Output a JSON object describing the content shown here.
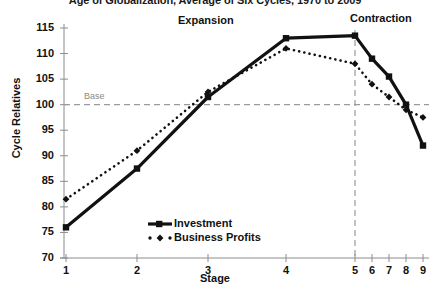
{
  "chart_data": {
    "type": "line",
    "title": "Age of Globalization, Average of Six Cycles, 1970 to 2009",
    "xlabel": "Stage",
    "ylabel": "Cycle Relatives",
    "categories": [
      "1",
      "2",
      "3",
      "4",
      "5",
      "6",
      "7",
      "8",
      "9"
    ],
    "x_tick_labels": [
      "1",
      "2",
      "3",
      "4",
      "5",
      "6",
      "7",
      "8",
      "9"
    ],
    "y_tick_labels": [
      "70",
      "75",
      "80",
      "85",
      "90",
      "95",
      "100",
      "105",
      "110",
      "115"
    ],
    "ylim": [
      70,
      115
    ],
    "grid": false,
    "legend_position": "inside-bottom-center",
    "series": [
      {
        "name": "Investment",
        "marker": "square",
        "line_style": "solid",
        "color": "#111111",
        "values": [
          76.0,
          87.5,
          101.5,
          113.0,
          113.5,
          109.0,
          105.5,
          100.0,
          92.0
        ]
      },
      {
        "name": "Business Profits",
        "marker": "diamond",
        "line_style": "dotted",
        "color": "#111111",
        "values": [
          81.5,
          91.0,
          102.5,
          111.0,
          108.0,
          104.0,
          101.5,
          99.0,
          97.5
        ]
      }
    ],
    "annotations": [
      {
        "name": "expansion-label",
        "text": "Expansion"
      },
      {
        "name": "contraction-label",
        "text": "Contraction"
      },
      {
        "name": "base-label",
        "text": "Base"
      }
    ],
    "reference_lines": [
      {
        "name": "base-line",
        "orientation": "horizontal",
        "value": 100,
        "style": "dashed",
        "color": "#9a9a9a"
      },
      {
        "name": "peak-divider",
        "orientation": "vertical",
        "value": 5,
        "style": "dashed",
        "color": "#9a9a9a"
      }
    ],
    "colors": {
      "series": "#111111",
      "reference": "#9a9a9a",
      "axis": "#8c8c8c",
      "text": "#111111"
    }
  },
  "legend": {
    "items": [
      {
        "label": "Investment"
      },
      {
        "label": "Business Profits"
      }
    ]
  }
}
